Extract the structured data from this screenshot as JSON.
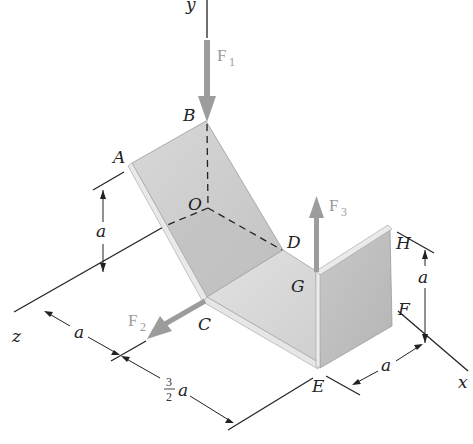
{
  "figure": {
    "axes": {
      "x": "x",
      "y": "y",
      "z": "z"
    },
    "points": {
      "A": "A",
      "B": "B",
      "C": "C",
      "D": "D",
      "E": "E",
      "F": "F",
      "G": "G",
      "H": "H",
      "O": "O"
    },
    "forces": [
      {
        "name": "F",
        "sub": "1"
      },
      {
        "name": "F",
        "sub": "2"
      },
      {
        "name": "F",
        "sub": "3"
      }
    ],
    "dimensions": {
      "height_left": "a",
      "z_offset": "a",
      "x_offset_num": "3",
      "x_offset_den": "2",
      "x_offset_var": "a",
      "right_height": "a",
      "right_depth": "a"
    },
    "colors": {
      "plate_light": "#d9d9d9",
      "plate_mid": "#c4c4c4",
      "plate_dark": "#b3b3b3",
      "edge": "#e8e8e8",
      "force": "#999999",
      "line": "#222222"
    }
  }
}
